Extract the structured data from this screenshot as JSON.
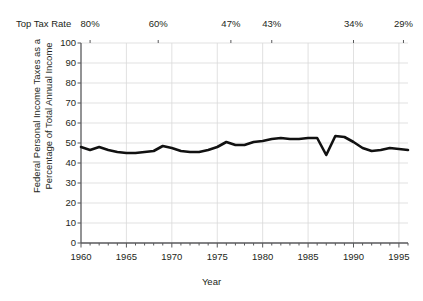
{
  "chart_data": {
    "type": "line",
    "title": "",
    "xlabel": "Year",
    "ylabel_line1": "Federal Personal Income Taxes as a",
    "ylabel_line2": "Percentage of Total Annual Income",
    "top_axis_title": "Top Tax Rate",
    "xlim": [
      1960,
      1996
    ],
    "ylim": [
      0,
      100
    ],
    "grid": true,
    "legend": "none",
    "line_color": "#111111",
    "grid_color": "#d9d9d9",
    "axis_color": "#58595b",
    "y_ticks": [
      100,
      90,
      80,
      70,
      60,
      50,
      40,
      30,
      20,
      10,
      0
    ],
    "x_ticks": [
      1960,
      1965,
      1970,
      1975,
      1980,
      1985,
      1990,
      1995
    ],
    "x_minor_tick_interval": 1,
    "top_axis_ticks": [
      {
        "label": "80%",
        "year": 1961
      },
      {
        "label": "60%",
        "year": 1968.5
      },
      {
        "label": "47%",
        "year": 1976.5
      },
      {
        "label": "43%",
        "year": 1981
      },
      {
        "label": "34%",
        "year": 1990
      },
      {
        "label": "29%",
        "year": 1995.5
      }
    ],
    "x": [
      1960,
      1961,
      1962,
      1963,
      1964,
      1965,
      1966,
      1967,
      1968,
      1969,
      1970,
      1971,
      1972,
      1973,
      1974,
      1975,
      1976,
      1977,
      1978,
      1979,
      1980,
      1981,
      1982,
      1983,
      1984,
      1985,
      1986,
      1987,
      1988,
      1989,
      1990,
      1991,
      1992,
      1993,
      1994,
      1995,
      1996
    ],
    "values": [
      48.0,
      46.5,
      48.0,
      46.5,
      45.5,
      45.0,
      45.0,
      45.5,
      46.0,
      48.5,
      47.5,
      46.0,
      45.5,
      45.5,
      46.5,
      48.0,
      50.5,
      49.0,
      49.0,
      50.5,
      51.0,
      52.0,
      52.5,
      52.0,
      52.0,
      52.5,
      52.5,
      44.0,
      53.5,
      53.0,
      50.5,
      47.5,
      46.0,
      46.5,
      47.5,
      47.0,
      46.5
    ],
    "series_name": "Federal Personal Income Taxes as a Percentage of Total Annual Income"
  }
}
